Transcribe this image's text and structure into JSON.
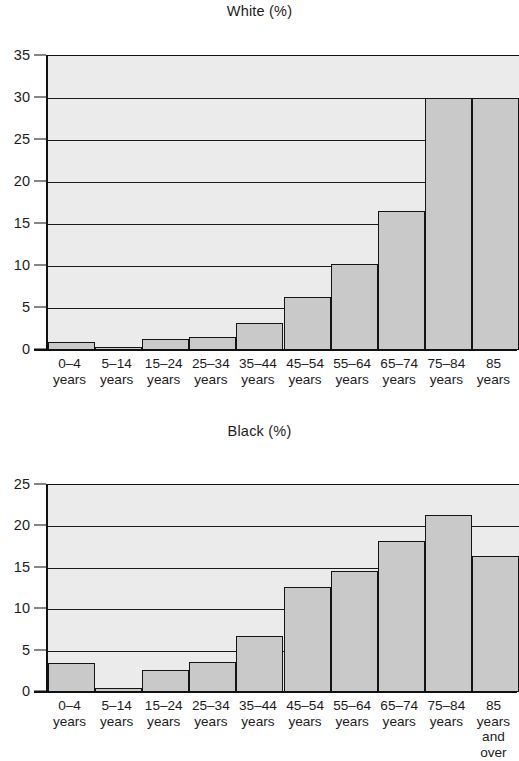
{
  "page": {
    "background": "#ffffff",
    "bar_fill": "#c9c9c9",
    "bar_stroke": "#141414",
    "plot_background": "#ebebeb",
    "axis_color": "#111111"
  },
  "charts": [
    {
      "id": "white",
      "title": "White (%)",
      "y_ticks": [
        "0",
        "5",
        "10",
        "15",
        "20",
        "25",
        "30",
        "35"
      ],
      "x_labels": [
        "0–4\nyears",
        "5–14\nyears",
        "15–24\nyears",
        "25–34\nyears",
        "35–44\nyears",
        "45–54\nyears",
        "55–64\nyears",
        "65–74\nyears",
        "75–84\nyears",
        "85\nyears"
      ]
    },
    {
      "id": "black",
      "title": "Black (%)",
      "y_ticks": [
        "0",
        "5",
        "10",
        "15",
        "20",
        "25"
      ],
      "x_labels": [
        "0–4\nyears",
        "5–14\nyears",
        "15–24\nyears",
        "25–34\nyears",
        "35–44\nyears",
        "45–54\nyears",
        "55–64\nyears",
        "65–74\nyears",
        "75–84\nyears",
        "85\nyears\nand\nover"
      ]
    }
  ],
  "chart_data": [
    {
      "type": "bar",
      "title": "White (%)",
      "xlabel": "",
      "ylabel": "",
      "categories": [
        "0-4 years",
        "5-14 years",
        "15-24 years",
        "25-34 years",
        "35-44 years",
        "45-54 years",
        "55-64 years",
        "65-74 years",
        "75-84 years",
        "85 years"
      ],
      "values": [
        0.9,
        0.3,
        1.3,
        1.5,
        3.2,
        6.3,
        10.2,
        16.6,
        30.0,
        30.0
      ],
      "ylim": [
        0,
        35
      ],
      "yticks": [
        0,
        5,
        10,
        15,
        20,
        25,
        30,
        35
      ],
      "grid": true,
      "legend": "none"
    },
    {
      "type": "bar",
      "title": "Black (%)",
      "xlabel": "",
      "ylabel": "",
      "categories": [
        "0-4 years",
        "5-14 years",
        "15-24 years",
        "25-34 years",
        "35-44 years",
        "45-54 years",
        "55-64 years",
        "65-74 years",
        "75-84 years",
        "85 years and over"
      ],
      "values": [
        3.5,
        0.5,
        2.6,
        3.6,
        6.8,
        12.7,
        14.6,
        18.2,
        21.4,
        16.4
      ],
      "ylim": [
        0,
        25
      ],
      "yticks": [
        0,
        5,
        10,
        15,
        20,
        25
      ],
      "grid": true,
      "legend": "none"
    }
  ]
}
